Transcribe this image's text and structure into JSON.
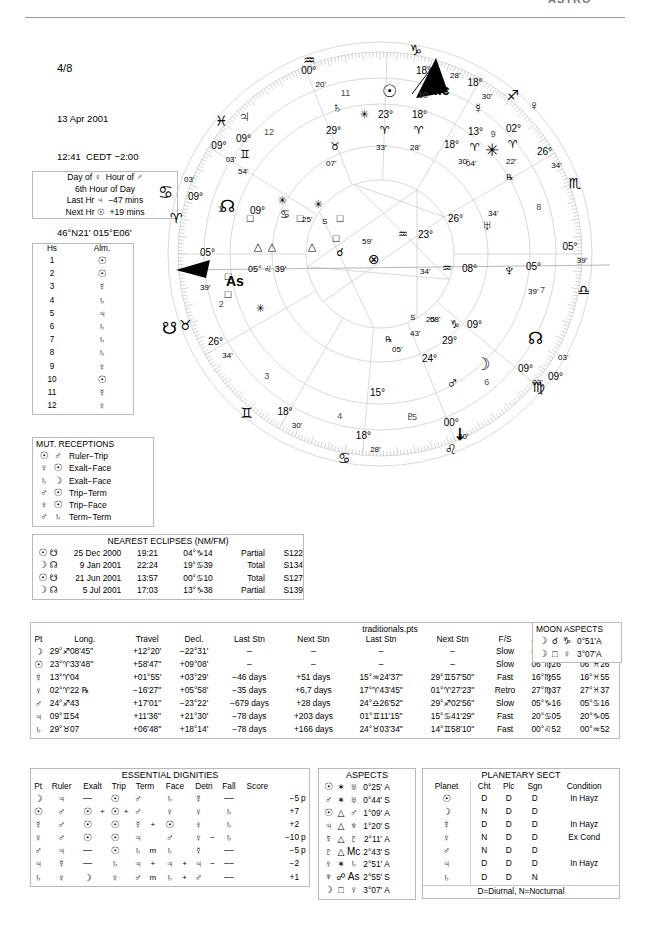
{
  "header": {
    "watermark": "ASTRO",
    "page_number": "4/8",
    "date": "13 Apr 2001",
    "time": "12:41  CEDT −2:00",
    "place": "Velenje, Slovenia",
    "coords": "46°N21' 015°E06'"
  },
  "day_hour": {
    "line1": "Day of ♀  Hour of ♂",
    "line2": "6th Hour of Day",
    "line3": "Last Hr ♃  −47 mins",
    "line4": "Next Hr ☉  +19 mins"
  },
  "almuten": {
    "col_house": "Hs",
    "col_almuten": "Alm.",
    "rows": [
      {
        "house": "1",
        "alm": "☉"
      },
      {
        "house": "2",
        "alm": "☉"
      },
      {
        "house": "3",
        "alm": "☿"
      },
      {
        "house": "4",
        "alm": "♄"
      },
      {
        "house": "5",
        "alm": "♃"
      },
      {
        "house": "6",
        "alm": "♄"
      },
      {
        "house": "7",
        "alm": "♄"
      },
      {
        "house": "8",
        "alm": "♄"
      },
      {
        "house": "9",
        "alm": "♀"
      },
      {
        "house": "10",
        "alm": "☉"
      },
      {
        "house": "11",
        "alm": "☿"
      },
      {
        "house": "12",
        "alm": "♀"
      }
    ]
  },
  "mutual_receptions": {
    "title": "MUT. RECEPTIONS",
    "rows": [
      {
        "a": "☉",
        "b": "♂",
        "kind": "Ruler−Trip"
      },
      {
        "a": "♀",
        "b": "☉",
        "kind": "Exalt−Face"
      },
      {
        "a": "♄",
        "b": "☽",
        "kind": "Exalt−Face"
      },
      {
        "a": "♂",
        "b": "☉",
        "kind": "Trip−Term"
      },
      {
        "a": "♀",
        "b": "☉",
        "kind": "Trip−Face"
      },
      {
        "a": "♂",
        "b": "♄",
        "kind": "Term−Term"
      }
    ]
  },
  "eclipses": {
    "title": "NEAREST ECLIPSES (NM/FM)",
    "rows": [
      {
        "body": "☉",
        "node": "☋",
        "date": "25 Dec 2000",
        "time": "19:21",
        "pos": "04°♑14",
        "type": "Partial",
        "saros": "S122"
      },
      {
        "body": "☽",
        "node": "☊",
        "date": "9 Jan 2001",
        "time": "22:24",
        "pos": "19°♋39",
        "type": "Total",
        "saros": "S134"
      },
      {
        "body": "☉",
        "node": "☋",
        "date": "21 Jun 2001",
        "time": "13:57",
        "pos": "00°♋10",
        "type": "Total",
        "saros": "S127"
      },
      {
        "body": "☽",
        "node": "☊",
        "date": "5 Jul 2001",
        "time": "17:03",
        "pos": "13°♑38",
        "type": "Partial",
        "saros": "S139"
      }
    ]
  },
  "traditionals": {
    "file_label": "traditionals.pts",
    "columns": [
      "Pt",
      "Long.",
      "Travel",
      "Decl.",
      "Last Stn",
      "Next Stn",
      "Last Stn",
      "Next Stn",
      "F/S",
      "Antiscia",
      "C.Ant."
    ],
    "rows": [
      {
        "pt": "☽",
        "long": "29°♐08'45\"",
        "travel": "+12°20'",
        "decl": "−22°31'",
        "last_days": "–",
        "next_days": "–",
        "last_stn": "–",
        "next_stn": "–",
        "fs": "Slow",
        "antiscia": "00°♑51",
        "cant": "00°♋51"
      },
      {
        "pt": "☉",
        "long": "23°♈33'48\"",
        "travel": "+58'47\"",
        "decl": "+09°08'",
        "last_days": "–",
        "next_days": "–",
        "last_stn": "–",
        "next_stn": "–",
        "fs": "Slow",
        "antiscia": "06°♍26",
        "cant": "06°♓26"
      },
      {
        "pt": "☿",
        "long": "13°♈04",
        "travel": "+01°55'",
        "decl": "+03°29'",
        "last_days": "−46 days",
        "next_days": "+51 days",
        "last_stn": "15°♒24'37\"",
        "next_stn": "29°♊57'50\"",
        "fs": "Fast",
        "antiscia": "16°♍55",
        "cant": "16°♓55"
      },
      {
        "pt": "♀",
        "long": "02°♈22 ℞",
        "travel": "−16'27\"",
        "decl": "+05°58'",
        "last_days": "−35 days",
        "next_days": "+6,7 days",
        "last_stn": "17°♈43'45\"",
        "next_stn": "01°♈27'23\"",
        "fs": "Retro",
        "antiscia": "27°♍37",
        "cant": "27°♓37"
      },
      {
        "pt": "♂",
        "long": "24°♐43",
        "travel": "+17'01\"",
        "decl": "−23°22'",
        "last_days": "−679 days",
        "next_days": "+28 days",
        "last_stn": "24°♎26'52\"",
        "next_stn": "29°♐02'56\"",
        "fs": "Slow",
        "antiscia": "05°♑16",
        "cant": "05°♋16"
      },
      {
        "pt": "♃",
        "long": "09°♊54",
        "travel": "+11'36\"",
        "decl": "+21°30'",
        "last_days": "−78 days",
        "next_days": "+203 days",
        "last_stn": "01°♊11'15\"",
        "next_stn": "15°♋41'29\"",
        "fs": "Fast",
        "antiscia": "20°♋05",
        "cant": "20°♑05"
      },
      {
        "pt": "♄",
        "long": "29°♉07",
        "travel": "+06'48\"",
        "decl": "+18°14'",
        "last_days": "−78 days",
        "next_days": "+166 days",
        "last_stn": "24°♉03'34\"",
        "next_stn": "14°♊58'10\"",
        "fs": "Fast",
        "antiscia": "00°♌52",
        "cant": "00°♒52"
      }
    ]
  },
  "moon_aspects": {
    "title": "MOON ASPECTS",
    "rows": [
      {
        "body": "☽",
        "aspect": "☌",
        "other": "♑",
        "orb": "0°51'",
        "ap": "A"
      },
      {
        "body": "☽",
        "aspect": "□",
        "other": "♀",
        "orb": "3°07'",
        "ap": "A"
      }
    ]
  },
  "dignities": {
    "title": "ESSENTIAL DIGNITIES",
    "columns": [
      "Pt",
      "Ruler",
      "Exalt",
      "Trip",
      "Term",
      "Face",
      "Detri",
      "Fall",
      "Score"
    ],
    "rows": [
      {
        "pt": "☽",
        "ruler": "♃",
        "exalt": "––",
        "exalt_mark": "",
        "trip": "☉",
        "trip_mark": "",
        "term": "♂",
        "term_mark": "",
        "face": "♄",
        "face_mark": "",
        "detri": "☿",
        "detri_mark": "",
        "fall": "––",
        "score": "−5",
        "peregrine": "p"
      },
      {
        "pt": "☉",
        "ruler": "♂",
        "exalt": "☉",
        "exalt_mark": "+",
        "trip": "☉",
        "trip_mark": "+",
        "term": "♂",
        "term_mark": "",
        "face": "♀",
        "face_mark": "",
        "detri": "♀",
        "detri_mark": "",
        "fall": "♄",
        "score": "+7",
        "peregrine": ""
      },
      {
        "pt": "☿",
        "ruler": "♂",
        "exalt": "☉",
        "exalt_mark": "",
        "trip": "☉",
        "trip_mark": "",
        "term": "☿",
        "term_mark": "+",
        "face": "☉",
        "face_mark": "",
        "detri": "♀",
        "detri_mark": "",
        "fall": "♄",
        "score": "+2",
        "peregrine": ""
      },
      {
        "pt": "♀",
        "ruler": "♂",
        "exalt": "☉",
        "exalt_mark": "",
        "trip": "☉",
        "trip_mark": "",
        "term": "♃",
        "term_mark": "",
        "face": "♂",
        "face_mark": "",
        "detri": "♀",
        "detri_mark": "−",
        "fall": "♄",
        "score": "−10",
        "peregrine": "p"
      },
      {
        "pt": "♂",
        "ruler": "♃",
        "exalt": "––",
        "exalt_mark": "",
        "trip": "☉",
        "trip_mark": "",
        "term": "♄",
        "term_mark": "m",
        "face": "♄",
        "face_mark": "",
        "detri": "☿",
        "detri_mark": "",
        "fall": "––",
        "score": "−5",
        "peregrine": "p"
      },
      {
        "pt": "♃",
        "ruler": "☿",
        "exalt": "––",
        "exalt_mark": "",
        "trip": "♄",
        "trip_mark": "",
        "term": "♃",
        "term_mark": "+",
        "face": "♃",
        "face_mark": "+",
        "detri": "♃",
        "detri_mark": "−",
        "fall": "––",
        "score": "−2",
        "peregrine": ""
      },
      {
        "pt": "♄",
        "ruler": "♀",
        "exalt": "☽",
        "exalt_mark": "",
        "trip": "♀",
        "trip_mark": "",
        "term": "♂",
        "term_mark": "m",
        "face": "♄",
        "face_mark": "+",
        "detri": "♂",
        "detri_mark": "",
        "fall": "––",
        "score": "+1",
        "peregrine": ""
      }
    ]
  },
  "aspects": {
    "title": "ASPECTS",
    "rows": [
      {
        "a": "☉",
        "asp": "✶",
        "b": "♅",
        "orb": "0°25'",
        "ap": "A"
      },
      {
        "a": "♂",
        "asp": "✶",
        "b": "♅",
        "orb": "0°44'",
        "ap": "S"
      },
      {
        "a": "☉",
        "asp": "△",
        "b": "♂",
        "orb": "1°09'",
        "ap": "A"
      },
      {
        "a": "♃",
        "asp": "△",
        "b": "♆",
        "orb": "1°20'",
        "ap": "S"
      },
      {
        "a": "☿",
        "asp": "△",
        "b": "♇",
        "orb": "2°11'",
        "ap": "A"
      },
      {
        "a": "♇",
        "asp": "△",
        "b": "Mc",
        "orb": "2°43'",
        "ap": "S"
      },
      {
        "a": "♀",
        "asp": "✶",
        "b": "♄",
        "orb": "2°51'",
        "ap": "A"
      },
      {
        "a": "♆",
        "asp": "☍",
        "b": "As",
        "orb": "2°55'",
        "ap": "S"
      },
      {
        "a": "☽",
        "asp": "□",
        "b": "♀",
        "orb": "3°07'",
        "ap": "A"
      }
    ]
  },
  "planetary_sect": {
    "title": "PLANETARY SECT",
    "columns": [
      "Planet",
      "Cht",
      "Plc",
      "Sgn",
      "Condition"
    ],
    "footer": "D=Diurnal, N=Nocturnal",
    "rows": [
      {
        "planet": "☉",
        "cht": "D",
        "plc": "D",
        "sgn": "D",
        "cond": "In Hayz"
      },
      {
        "planet": "☽",
        "cht": "N",
        "plc": "D",
        "sgn": "N",
        "cond": "",
        "sgn2": "D"
      },
      {
        "planet": "☿",
        "cht": "D",
        "plc": "D",
        "sgn": "D",
        "cond": "In Hayz"
      },
      {
        "planet": "♀",
        "cht": "N",
        "plc": "D",
        "sgn": "D",
        "cond": "Ex Cond",
        "sgn2": "D"
      },
      {
        "planet": "♂",
        "cht": "N",
        "plc": "D",
        "sgn": "N",
        "cond": "",
        "sgn2": "D"
      },
      {
        "planet": "♃",
        "cht": "D",
        "plc": "D",
        "sgn": "D",
        "cond": "In Hayz"
      },
      {
        "planet": "♄",
        "cht": "D",
        "plc": "D",
        "sgn": "D",
        "cond": "",
        "sgn2": "N"
      }
    ]
  },
  "chart_wheel": {
    "angles": [
      {
        "name": "Ascendant",
        "label": "As",
        "deg": "05°",
        "min": "39'",
        "sign_pos": "05° ♌ 39'"
      },
      {
        "name": "Midheaven",
        "label": "Mc",
        "deg": "18°",
        "min": "28'"
      }
    ],
    "house_numbers": [
      "1",
      "2",
      "3",
      "4",
      "5",
      "6",
      "7",
      "8",
      "9",
      "10",
      "11",
      "12"
    ],
    "cusps": [
      {
        "house": "1",
        "deg": "05°",
        "min": "39'",
        "sign": "♌"
      },
      {
        "house": "2",
        "deg": "26°",
        "min": "34'",
        "sign": "♍"
      },
      {
        "house": "3",
        "deg": "18°",
        "min": "30'",
        "sign": "♎"
      },
      {
        "house": "4",
        "deg": "18°",
        "min": "28'",
        "sign": "♏"
      },
      {
        "house": "5",
        "deg": "00°",
        "min": "20'",
        "sign": "♐"
      },
      {
        "house": "6",
        "deg": "09°",
        "min": "03'",
        "sign": "♑"
      },
      {
        "house": "7",
        "deg": "05°",
        "min": "39'",
        "sign": "♒"
      },
      {
        "house": "8",
        "deg": "26°",
        "min": "34'",
        "sign": "♓"
      },
      {
        "house": "9",
        "deg": "18°",
        "min": "30'",
        "sign": "♈"
      },
      {
        "house": "10",
        "deg": "18°",
        "min": "28'",
        "sign": "♉"
      },
      {
        "house": "11",
        "deg": "00°",
        "min": "20'",
        "sign": "♊"
      },
      {
        "house": "12",
        "deg": "09°",
        "min": "03'",
        "sign": "♋"
      }
    ],
    "planets": [
      {
        "name": "Sun",
        "glyph": "☉",
        "deg": "23°",
        "sign": "♈",
        "min": "33'"
      },
      {
        "name": "Mercury",
        "glyph": "☿",
        "deg": "13°",
        "sign": "♈",
        "min": "04'"
      },
      {
        "name": "Venus",
        "glyph": "♀",
        "deg": "02°",
        "sign": "♈",
        "min": "22'",
        "retro": "℞"
      },
      {
        "name": "Saturn",
        "glyph": "♄",
        "deg": "29°",
        "sign": "♉",
        "min": "07'"
      },
      {
        "name": "Jupiter",
        "glyph": "♃",
        "deg": "09°",
        "sign": "♊",
        "min": "54'"
      },
      {
        "name": "Chiron",
        "glyph": "⚷",
        "deg": "18°",
        "min": "30'"
      },
      {
        "name": "Uranus",
        "glyph": "♅",
        "deg": "26°",
        "sign": "♒",
        "min": "34'",
        "extra": "23°  59'"
      },
      {
        "name": "Neptune",
        "glyph": "♆",
        "deg": "05°",
        "sign": "♒",
        "min": "39'",
        "extra": "08°  34'"
      },
      {
        "name": "Pluto",
        "glyph": "♇",
        "deg": "15°"
      },
      {
        "name": "Moon",
        "glyph": "☽",
        "deg": "29°",
        "min": "08'"
      },
      {
        "name": "Mars",
        "glyph": "♂",
        "deg": "24°",
        "min": "43'",
        "retro": "℞",
        "extra": "05'"
      },
      {
        "name": "NorthNode",
        "glyph": "☊",
        "deg": "03°",
        "min": "09'"
      },
      {
        "name": "SouthNode",
        "glyph": "☋",
        "deg": "09°",
        "min": "03'"
      },
      {
        "name": "PartFortune",
        "glyph": "⊗"
      },
      {
        "name": "Vertex",
        "glyph": "Vx"
      },
      {
        "name": "Lilith",
        "glyph": "⚸",
        "deg": "09°",
        "min": "25'"
      }
    ],
    "sign_glyphs": [
      "♈",
      "♉",
      "♊",
      "♋",
      "♌",
      "♍",
      "♎",
      "♏",
      "♐",
      "♑",
      "♒",
      "♓"
    ]
  }
}
